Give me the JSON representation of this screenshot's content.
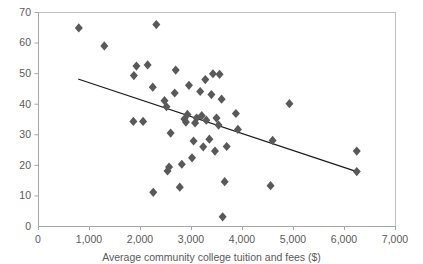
{
  "chart_data": {
    "type": "scatter",
    "title": "",
    "xlabel": "Average community college tuition and fees ($)",
    "ylabel": "",
    "xlim": [
      0,
      7000
    ],
    "ylim": [
      0,
      70
    ],
    "xticks": [
      0,
      1000,
      2000,
      3000,
      4000,
      5000,
      6000,
      7000
    ],
    "xtick_labels": [
      "0",
      "1,000",
      "2,000",
      "3,000",
      "4,000",
      "5,000",
      "6,000",
      "7,000"
    ],
    "yticks": [
      0,
      10,
      20,
      30,
      40,
      50,
      60,
      70
    ],
    "ytick_labels": [
      "0",
      "10",
      "20",
      "30",
      "40",
      "50",
      "60",
      "70"
    ],
    "grid": false,
    "legend": null,
    "marker": "diamond",
    "marker_color": "#595959",
    "points": [
      {
        "x": 800,
        "y": 64.8
      },
      {
        "x": 1300,
        "y": 58.9
      },
      {
        "x": 1880,
        "y": 49.2
      },
      {
        "x": 1930,
        "y": 52.3
      },
      {
        "x": 2150,
        "y": 52.7
      },
      {
        "x": 2320,
        "y": 65.9
      },
      {
        "x": 1870,
        "y": 34.2
      },
      {
        "x": 2060,
        "y": 34.2
      },
      {
        "x": 2250,
        "y": 45.4
      },
      {
        "x": 2260,
        "y": 11.0
      },
      {
        "x": 2480,
        "y": 41.0
      },
      {
        "x": 2520,
        "y": 39.0
      },
      {
        "x": 2540,
        "y": 18.0
      },
      {
        "x": 2570,
        "y": 19.3
      },
      {
        "x": 2600,
        "y": 30.4
      },
      {
        "x": 2680,
        "y": 43.5
      },
      {
        "x": 2700,
        "y": 51.0
      },
      {
        "x": 2780,
        "y": 12.7
      },
      {
        "x": 2820,
        "y": 20.2
      },
      {
        "x": 2870,
        "y": 35.0
      },
      {
        "x": 2900,
        "y": 34.0
      },
      {
        "x": 2930,
        "y": 36.5
      },
      {
        "x": 2960,
        "y": 46.0
      },
      {
        "x": 3020,
        "y": 22.3
      },
      {
        "x": 3050,
        "y": 27.8
      },
      {
        "x": 3080,
        "y": 33.7
      },
      {
        "x": 3110,
        "y": 35.3
      },
      {
        "x": 3180,
        "y": 44.0
      },
      {
        "x": 3210,
        "y": 36.1
      },
      {
        "x": 3240,
        "y": 25.9
      },
      {
        "x": 3280,
        "y": 47.9
      },
      {
        "x": 3300,
        "y": 34.6
      },
      {
        "x": 3360,
        "y": 28.4
      },
      {
        "x": 3400,
        "y": 43.0
      },
      {
        "x": 3430,
        "y": 49.8
      },
      {
        "x": 3470,
        "y": 24.5
      },
      {
        "x": 3500,
        "y": 35.3
      },
      {
        "x": 3540,
        "y": 33.0
      },
      {
        "x": 3560,
        "y": 49.6
      },
      {
        "x": 3600,
        "y": 41.5
      },
      {
        "x": 3620,
        "y": 3.0
      },
      {
        "x": 3660,
        "y": 14.5
      },
      {
        "x": 3700,
        "y": 26.0
      },
      {
        "x": 3880,
        "y": 36.8
      },
      {
        "x": 3920,
        "y": 31.6
      },
      {
        "x": 4560,
        "y": 13.2
      },
      {
        "x": 4600,
        "y": 28.0
      },
      {
        "x": 4930,
        "y": 40.0
      },
      {
        "x": 6250,
        "y": 24.5
      },
      {
        "x": 6250,
        "y": 17.8
      }
    ],
    "trendline": {
      "x1": 800,
      "y1": 48.0,
      "x2": 6250,
      "y2": 17.8,
      "color": "#1a1a1a"
    }
  },
  "style": {
    "plot_border_color": "#c0c0c0",
    "axis_color": "#a6a6a6",
    "text_color": "#595959"
  }
}
